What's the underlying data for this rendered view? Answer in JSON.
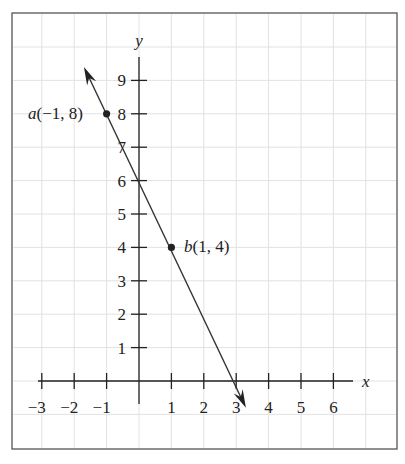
{
  "chart_data": {
    "type": "line",
    "title": "",
    "xlabel": "x",
    "ylabel": "y",
    "xlim": [
      -3.5,
      6.5
    ],
    "ylim": [
      0,
      9.6
    ],
    "grid": true,
    "x_ticks": [
      -3,
      -2,
      -1,
      1,
      2,
      3,
      4,
      5,
      6
    ],
    "x_tick_labels": [
      "−3",
      "−2",
      "−1",
      "1",
      "2",
      "3",
      "4",
      "5",
      "6"
    ],
    "y_ticks": [
      1,
      2,
      3,
      4,
      5,
      6,
      7,
      8,
      9
    ],
    "y_tick_labels": [
      "1",
      "2",
      "3",
      "4",
      "5",
      "6",
      "7",
      "8",
      "9"
    ],
    "series": [
      {
        "name": "line through a and b",
        "equation": "y = -2x + 6",
        "x": [
          -1.7,
          3.3
        ],
        "y": [
          9.4,
          -0.8
        ],
        "arrows": "both"
      }
    ],
    "points": [
      {
        "name": "a",
        "x": -1,
        "y": 8,
        "label": "a(−1, 8)"
      },
      {
        "name": "b",
        "x": 1,
        "y": 4,
        "label": "b(1, 4)"
      }
    ]
  },
  "labels": {
    "x_axis": "x",
    "y_axis": "y",
    "point_a_name": "a",
    "point_a_coords": "(−1, 8)",
    "point_b_name": "b",
    "point_b_coords": "(1, 4)"
  }
}
